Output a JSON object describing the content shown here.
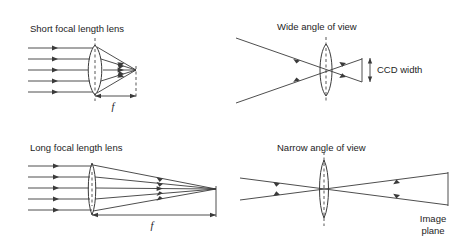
{
  "figure": {
    "background_color": "#ffffff",
    "line_color": "#3a3a3a",
    "text_color": "#1d1d1d",
    "width": 467,
    "height": 245
  },
  "panels": {
    "top_left": {
      "caption": "Short focal length lens",
      "focal_label": "f",
      "lens_type": "biconvex",
      "ray_count": 5,
      "ray_direction": "left-to-right parallel converging"
    },
    "top_right": {
      "caption": "Wide angle of view",
      "detector_label": "CCD width",
      "lens_type": "biconvex",
      "ray_count": 2,
      "ray_direction": "wide cone crossing at lens"
    },
    "bottom_left": {
      "caption": "Long focal length lens",
      "focal_label": "f",
      "lens_type": "biconvex-narrow",
      "ray_count": 5,
      "ray_direction": "left-to-right parallel converging"
    },
    "bottom_right": {
      "caption": "Narrow angle of view",
      "plane_label_line1": "Image",
      "plane_label_line2": "plane",
      "lens_type": "biconvex-narrow",
      "ray_count": 2,
      "ray_direction": "narrow cone crossing at lens"
    }
  }
}
